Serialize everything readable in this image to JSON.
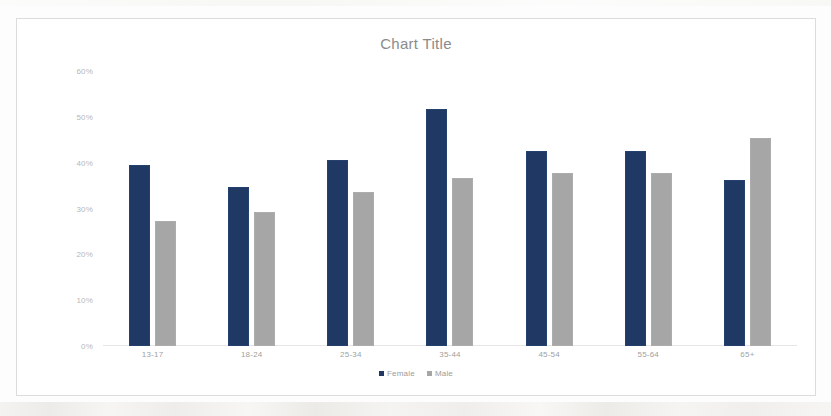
{
  "chart_data": {
    "type": "bar",
    "title": "Chart Title",
    "xlabel": "",
    "ylabel": "",
    "categories": [
      "13-17",
      "18-24",
      "25-34",
      "35-44",
      "45-54",
      "55-64",
      "65+"
    ],
    "series": [
      {
        "name": "Female",
        "color": "#1F3864",
        "values": [
          37,
          32.5,
          38,
          48.5,
          40,
          40,
          34
        ]
      },
      {
        "name": "Male",
        "color": "#A6A6A6",
        "values": [
          25.5,
          27.5,
          31.5,
          34.5,
          35.5,
          35.5,
          42.5
        ]
      }
    ],
    "ylim": [
      0,
      60
    ],
    "y_ticks": [
      "0%",
      "10%",
      "20%",
      "30%",
      "40%",
      "50%",
      "60%"
    ],
    "y_tick_values": [
      0,
      10,
      20,
      30,
      40,
      50,
      60
    ],
    "grid": false,
    "legend_position": "bottom",
    "legend_entries": [
      "Female",
      "Male"
    ]
  },
  "colors": {
    "female": "#1F3864",
    "male": "#A6A6A6",
    "title_text": "#8B8B8B",
    "tick_text": "#B7B7B7",
    "axis_line": "#E6E6E6",
    "card_border": "#DCDCDC",
    "background": "#FFFFFF"
  }
}
